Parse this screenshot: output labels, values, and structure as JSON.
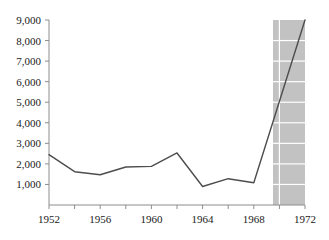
{
  "chart_data": {
    "type": "line",
    "title": "",
    "subtitle": "",
    "xlabel": "",
    "ylabel": "",
    "x": [
      1952,
      1954,
      1956,
      1958,
      1960,
      1962,
      1964,
      1966,
      1968,
      1972
    ],
    "values": [
      2450,
      1620,
      1470,
      1850,
      1880,
      2530,
      900,
      1280,
      1080,
      9000
    ],
    "series": [
      {
        "name": "",
        "x": [
          1952,
          1954,
          1956,
          1958,
          1960,
          1962,
          1964,
          1966,
          1968,
          1972
        ],
        "values": [
          2450,
          1620,
          1470,
          1850,
          1880,
          2530,
          900,
          1280,
          1080,
          9000
        ]
      }
    ],
    "xlim": [
      1952,
      1972
    ],
    "ylim": [
      0,
      9000
    ],
    "y_ticks": [
      1000,
      2000,
      3000,
      4000,
      5000,
      6000,
      7000,
      8000,
      9000
    ],
    "y_tick_labels": [
      "1,000",
      "2,000",
      "3,000",
      "4,000",
      "5,000",
      "6,000",
      "7,000",
      "8,000",
      "9,000"
    ],
    "x_ticks": [
      1952,
      1954,
      1956,
      1958,
      1960,
      1962,
      1964,
      1966,
      1968,
      1970,
      1972
    ],
    "x_tick_labels_shown": [
      "1952",
      "1956",
      "1960",
      "1964",
      "1968",
      "1972"
    ],
    "x_labeled_ticks": [
      1952,
      1956,
      1960,
      1964,
      1968,
      1972
    ],
    "grid": false,
    "legend": "none",
    "shaded_region": {
      "x_start": 1969.5,
      "x_end": 1972,
      "color": "#c2c2c2",
      "gridline_color": "#ffffff",
      "gridlines_horizontal": [
        1000,
        2000,
        3000,
        4000,
        5000,
        6000,
        7000,
        8000
      ],
      "gridlines_vertical": [
        1970
      ]
    },
    "line_color": "#4d4d4d",
    "axis_color": "#8c8c8c",
    "background_color": "#ffffff",
    "text_color": "#1a1a1a"
  }
}
